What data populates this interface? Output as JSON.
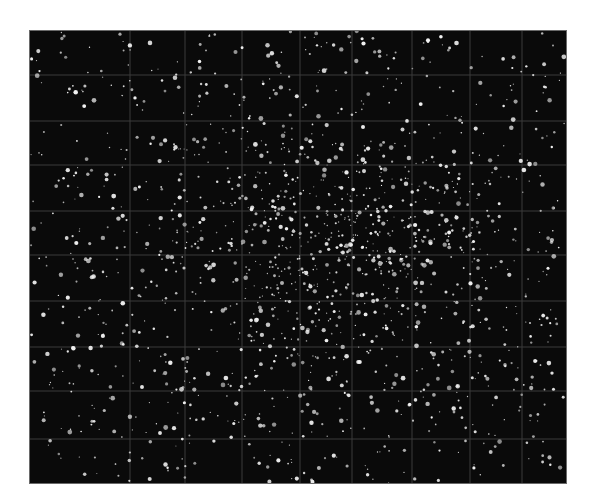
{
  "image": {
    "description": "Astronomical photographic plate of a dense star cluster with reseau grid lines",
    "caption": "",
    "colors": {
      "background": "#ffffff",
      "sky": "#0a0a0a",
      "star": "#f2f2f2",
      "grid": "#3a3a3a",
      "frame": "#6a6a6a"
    },
    "frame": {
      "x": 30,
      "y": 31,
      "width": 536,
      "height": 452
    },
    "grid": {
      "vertical_x": [
        100,
        155,
        212,
        270,
        322,
        382,
        440,
        492
      ],
      "horizontal_y": [
        44,
        90,
        134,
        180,
        224,
        270,
        316,
        360,
        408
      ]
    },
    "stars": {
      "field_count": 900,
      "cluster_count": 700,
      "cluster_center": [
        300,
        225
      ],
      "cluster_sigma": [
        95,
        75
      ],
      "seed": 12345,
      "radius_range": [
        0.6,
        2.4
      ]
    }
  }
}
